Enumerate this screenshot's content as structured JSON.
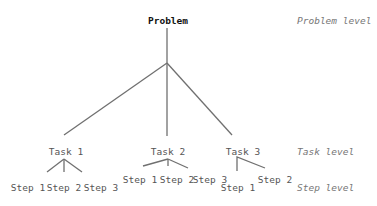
{
  "diagram": {
    "root": {
      "label": "Problem"
    },
    "tasks": [
      {
        "label": "Task 1",
        "steps": [
          "Step 1",
          "Step 2",
          "Step 3"
        ]
      },
      {
        "label": "Task 2",
        "steps": [
          "Step 1",
          "Step 2",
          "Step 3"
        ]
      },
      {
        "label": "Task 3",
        "steps": [
          "Step 1",
          "Step 2"
        ]
      }
    ],
    "levels": {
      "problem": "Problem level",
      "task": "Task level",
      "step": "Step level"
    },
    "line_color": "#707070"
  }
}
